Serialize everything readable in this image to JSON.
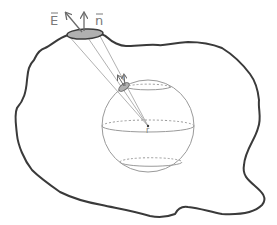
{
  "diagram": {
    "labels": {
      "field_vector": "E",
      "normal_vector": "n",
      "position_vector": "r",
      "center_vector": "r"
    },
    "colors": {
      "boundary": "#3a3a3a",
      "sphere": "#9a9a9a",
      "rays": "#a8a8a8",
      "patch_fill": "#b0b0b0",
      "arrow": "#6a6a6a"
    },
    "elements": [
      "closed-surface-boundary",
      "surface-patch",
      "field-arrow-E",
      "normal-arrow-n",
      "sphere",
      "cone-rays",
      "small-patch-on-sphere",
      "center-point"
    ]
  }
}
